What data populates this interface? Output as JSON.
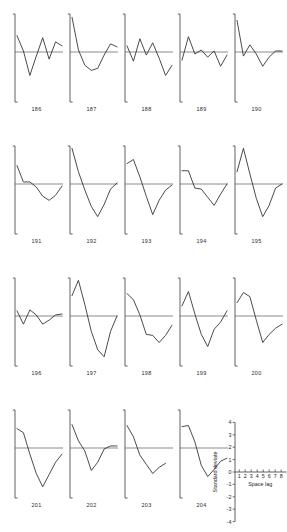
{
  "figure": {
    "title": "",
    "panel_count": 19,
    "rows": 4,
    "columns": 5
  },
  "legend": {
    "ylabel": "Standard deviate",
    "xlabel": "Space lag",
    "yticks": [
      "4",
      "3",
      "2",
      "1",
      "0",
      "-1",
      "-2",
      "-3",
      "-4"
    ],
    "xticks": [
      "1",
      "2",
      "3",
      "4",
      "5",
      "6",
      "7",
      "8"
    ]
  },
  "chart_data": {
    "type": "line",
    "title": "",
    "xlabel": "Space lag",
    "ylabel": "Standard deviate",
    "x": [
      1,
      2,
      3,
      4,
      5,
      6,
      7,
      8
    ],
    "xlim": [
      1,
      8
    ],
    "ylim": [
      -4,
      4
    ],
    "grid": false,
    "legend_position": "bottom-right-key-panel",
    "series": [
      {
        "name": "186",
        "values": [
          1.6,
          0.1,
          -2.3,
          -0.4,
          1.4,
          -0.7,
          1.0,
          0.6
        ]
      },
      {
        "name": "187",
        "values": [
          3.4,
          0.2,
          -1.3,
          -1.8,
          -1.6,
          -0.3,
          0.8,
          0.5
        ]
      },
      {
        "name": "188",
        "values": [
          0.6,
          -0.9,
          1.3,
          -0.3,
          0.9,
          -0.6,
          -2.3,
          -1.3
        ]
      },
      {
        "name": "189",
        "values": [
          -0.8,
          1.5,
          -0.2,
          0.2,
          -0.5,
          0.1,
          -1.4,
          -0.3
        ]
      },
      {
        "name": "190",
        "values": [
          3.1,
          -0.4,
          0.7,
          -0.2,
          -1.4,
          -0.5,
          0.1,
          0.1
        ]
      },
      {
        "name": "191",
        "values": [
          1.8,
          0.2,
          0.2,
          -0.3,
          -1.2,
          -1.6,
          -1.1,
          -0.2
        ]
      },
      {
        "name": "192",
        "values": [
          3.5,
          1.2,
          -0.6,
          -2.2,
          -3.2,
          -2.0,
          -0.5,
          0.1
        ]
      },
      {
        "name": "193",
        "values": [
          2.0,
          2.4,
          0.7,
          -1.2,
          -3.0,
          -1.6,
          -0.6,
          -0.1
        ]
      },
      {
        "name": "194",
        "values": [
          1.3,
          1.3,
          -0.4,
          -0.5,
          -1.3,
          -2.1,
          -1.0,
          0.0
        ]
      },
      {
        "name": "195",
        "values": [
          1.2,
          3.5,
          1.0,
          -1.4,
          -3.2,
          -2.1,
          -0.4,
          0.0
        ]
      },
      {
        "name": "196",
        "values": [
          0.5,
          -0.8,
          0.6,
          0.1,
          -0.8,
          -0.4,
          0.1,
          0.2
        ]
      },
      {
        "name": "197",
        "values": [
          2.0,
          3.5,
          1.1,
          -1.5,
          -3.3,
          -4.0,
          -1.5,
          0.0
        ]
      },
      {
        "name": "198",
        "values": [
          2.2,
          1.6,
          0.1,
          -1.8,
          -1.9,
          -2.6,
          -1.9,
          -0.9
        ]
      },
      {
        "name": "199",
        "values": [
          1.0,
          2.4,
          0.2,
          -1.8,
          -3.0,
          -1.3,
          -0.6,
          0.5
        ]
      },
      {
        "name": "200",
        "values": [
          1.3,
          2.3,
          1.9,
          -0.4,
          -2.6,
          -1.8,
          -1.2,
          -0.8
        ]
      },
      {
        "name": "201",
        "values": [
          1.9,
          1.5,
          -0.6,
          -2.5,
          -3.8,
          -2.6,
          -1.4,
          -0.6
        ]
      },
      {
        "name": "202",
        "values": [
          2.3,
          0.7,
          -0.3,
          -2.2,
          -1.4,
          -0.1,
          0.2,
          0.2
        ]
      },
      {
        "name": "203",
        "values": [
          2.2,
          1.1,
          -0.7,
          -1.6,
          -2.5,
          -1.9,
          -1.5,
          null
        ]
      },
      {
        "name": "204",
        "values": [
          2.1,
          2.2,
          0.6,
          -1.7,
          -2.8,
          -2.1,
          -1.3,
          -1.0
        ]
      }
    ]
  },
  "panels": [
    {
      "label": "186"
    },
    {
      "label": "187"
    },
    {
      "label": "188"
    },
    {
      "label": "189"
    },
    {
      "label": "190"
    },
    {
      "label": "191"
    },
    {
      "label": "192"
    },
    {
      "label": "193"
    },
    {
      "label": "194"
    },
    {
      "label": "195"
    },
    {
      "label": "196"
    },
    {
      "label": "197"
    },
    {
      "label": "198"
    },
    {
      "label": "199"
    },
    {
      "label": "200"
    },
    {
      "label": "201"
    },
    {
      "label": "202"
    },
    {
      "label": "203"
    },
    {
      "label": "204"
    }
  ]
}
